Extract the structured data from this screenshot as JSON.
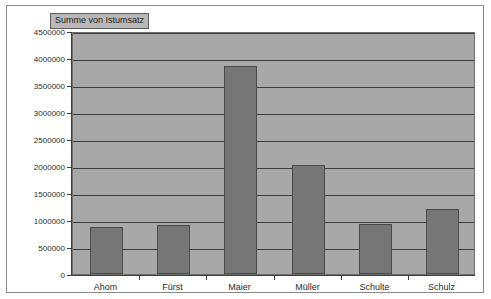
{
  "chart_data": {
    "type": "bar",
    "title": "Summe von Istumsatz",
    "xlabel": "",
    "ylabel": "",
    "categories": [
      "Ahom",
      "Fürst",
      "Maier",
      "Müller",
      "Schulte",
      "Schulz"
    ],
    "values": [
      873000,
      910000,
      3854000,
      2013000,
      930000,
      1200000
    ],
    "series": [
      {
        "name": "Summe von Istumsatz",
        "values": [
          873000,
          910000,
          3854000,
          2013000,
          930000,
          1200000
        ]
      }
    ],
    "ylim": [
      0,
      4500000
    ],
    "ytick_step": 500000,
    "ytick_labels": [
      "4500000",
      "4000000",
      "3500000",
      "3000000",
      "2500000",
      "2000000",
      "1500000",
      "1000000",
      "500000",
      "0"
    ],
    "ytick_values": [
      4500000,
      4000000,
      3500000,
      3000000,
      2500000,
      2000000,
      1500000,
      1000000,
      500000,
      0
    ],
    "grid": true,
    "legend_position": "top-left",
    "colors": {
      "bar_fill": "#767676",
      "bar_border": "#4a4a4a",
      "plot_background": "#a8a8a8",
      "gridline": "#3d3d3d",
      "legend_background": "#b8b8b8",
      "axis_text": "#2b2b2b",
      "frame_border": "#8a8a8a"
    }
  },
  "legend": {
    "label": "Summe von Istumsatz"
  }
}
